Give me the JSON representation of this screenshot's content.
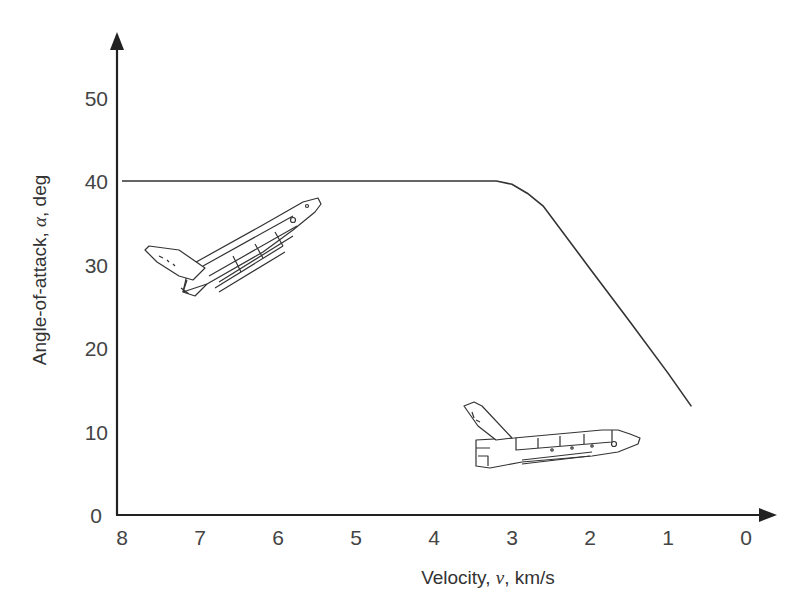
{
  "chart_data": {
    "type": "line",
    "title": "",
    "xlabel": "Velocity, v, km/s",
    "xlabel_parts": {
      "pre": "Velocity, ",
      "var": "v",
      "post": ", km/s"
    },
    "ylabel": "Angle-of-attack, α, deg",
    "ylabel_parts": {
      "pre": "Angle-of-attack, ",
      "var": "α",
      "post": ", deg"
    },
    "x_reversed": true,
    "xlim": [
      8,
      0
    ],
    "ylim": [
      0,
      55
    ],
    "xticks": [
      8,
      7,
      6,
      5,
      4,
      3,
      2,
      1,
      0
    ],
    "yticks": [
      0,
      10,
      20,
      30,
      40,
      50
    ],
    "grid": false,
    "legend": null,
    "series": [
      {
        "name": "Shuttle entry angle-of-attack profile",
        "x": [
          8.0,
          7.0,
          6.0,
          5.0,
          4.0,
          3.2,
          3.0,
          2.8,
          2.6,
          2.0,
          1.5,
          1.0,
          0.7
        ],
        "y": [
          40,
          40,
          40,
          40,
          40,
          40,
          39.6,
          38.5,
          37.0,
          29.5,
          23.3,
          17.0,
          13.0
        ]
      }
    ],
    "annotations": [
      {
        "type": "illustration",
        "name": "space-shuttle-high-alpha",
        "at": {
          "x": 6.5,
          "y": 32
        }
      },
      {
        "type": "illustration",
        "name": "space-shuttle-low-alpha",
        "at": {
          "x": 2.7,
          "y": 9
        }
      }
    ]
  },
  "colors": {
    "line": "#333333",
    "text": "#444444",
    "background": "#ffffff"
  }
}
